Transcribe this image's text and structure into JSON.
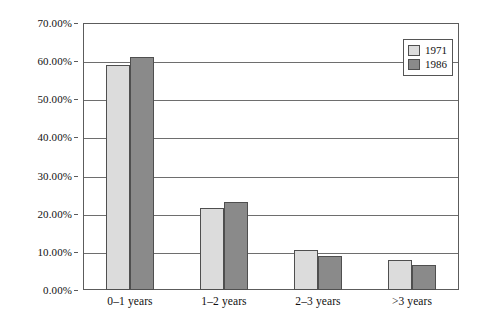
{
  "chart_data": {
    "type": "bar",
    "title": "",
    "subtitle": "",
    "xlabel": "",
    "ylabel": "",
    "categories": [
      "0–1 years",
      "1–2 years",
      "2–3 years",
      ">3 years"
    ],
    "series": [
      {
        "name": "1971",
        "color": "#dcdcdc",
        "values": [
          59.0,
          21.5,
          10.5,
          8.0
        ]
      },
      {
        "name": "1986",
        "color": "#8a8a8a",
        "values": [
          61.0,
          23.0,
          9.0,
          6.5
        ]
      }
    ],
    "ylim": [
      0,
      70
    ],
    "ytick_values": [
      0,
      10,
      20,
      30,
      40,
      50,
      60,
      70
    ],
    "ytick_labels": [
      "0.00%",
      "10.00%",
      "20.00%",
      "30.00%",
      "40.00%",
      "50.00%",
      "60.00%",
      "70.00%"
    ],
    "grid": "horizontal",
    "legend_position": "top-right-inside",
    "legend_entries": [
      "1971",
      "1986"
    ],
    "annotations": []
  },
  "colors": {
    "series_1971": "#dcdcdc",
    "series_1986": "#8a8a8a",
    "bar_border": "#4f4f4f",
    "frame": "#5c5c5c",
    "gridline": "#6e6e6e",
    "background": "#ffffff",
    "text": "#111111"
  }
}
